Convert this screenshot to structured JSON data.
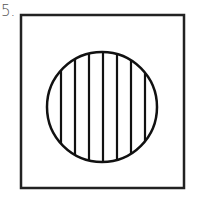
{
  "figure": {
    "number_label": "5.",
    "square": {
      "x": 21,
      "y": 15,
      "width": 163,
      "height": 173,
      "stroke": "#222222",
      "stroke_width": 2.5
    },
    "circle": {
      "cx": 102,
      "cy": 107,
      "r": 55,
      "stroke": "#111111",
      "stroke_width": 2.5
    },
    "vertical_lines": {
      "count": 7,
      "x_positions": [
        61,
        75,
        89,
        103,
        117,
        131,
        145
      ],
      "stroke": "#111111"
    }
  }
}
